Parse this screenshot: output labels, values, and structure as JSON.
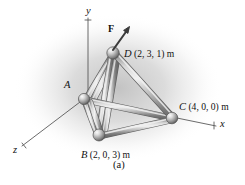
{
  "figure": {
    "caption": "(a)",
    "background_color": "#ffffff",
    "shade_color": "#c9c9c9",
    "member_color": "#b4b4b4",
    "label_color": "#111111"
  },
  "axes": [
    {
      "id": "y",
      "label": "y",
      "label_x": 86,
      "label_y": 11
    },
    {
      "id": "x",
      "label": "x",
      "label_x": 220,
      "label_y": 123
    },
    {
      "id": "z",
      "label": "z",
      "label_x": 13,
      "label_y": 149
    }
  ],
  "force": {
    "label": "F",
    "label_x": 108,
    "label_y": 26
  },
  "nodes": [
    {
      "id": "A",
      "name": "A",
      "coords_text": "",
      "label_x": 64,
      "label_y": 84,
      "px": 84,
      "py": 99
    },
    {
      "id": "B",
      "name": "B",
      "coords_text": "(2, 0, 3) m",
      "label_x": 81,
      "label_y": 148,
      "px": 99,
      "py": 135
    },
    {
      "id": "C",
      "name": "C",
      "coords_text": "(4, 0, 0) m",
      "label_x": 179,
      "label_y": 100,
      "px": 172,
      "py": 118
    },
    {
      "id": "D",
      "name": "D",
      "coords_text": "(2, 3, 1) m",
      "label_x": 124,
      "label_y": 47,
      "px": 113,
      "py": 53
    }
  ],
  "members": [
    {
      "from": "A",
      "to": "D"
    },
    {
      "from": "B",
      "to": "D"
    },
    {
      "from": "C",
      "to": "D"
    },
    {
      "from": "A",
      "to": "B"
    },
    {
      "from": "A",
      "to": "C"
    },
    {
      "from": "B",
      "to": "C"
    }
  ]
}
